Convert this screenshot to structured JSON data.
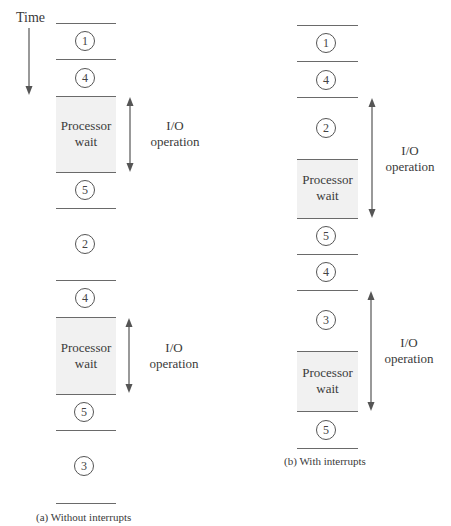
{
  "time_label": "Time",
  "panel_a": {
    "caption": "(a) Without interrupts",
    "segments": [
      {
        "type": "step",
        "label": "1"
      },
      {
        "type": "step",
        "label": "4"
      },
      {
        "type": "wait",
        "label_line1": "Processor",
        "label_line2": "wait"
      },
      {
        "type": "step",
        "label": "5"
      },
      {
        "type": "step",
        "label": "2"
      },
      {
        "type": "step",
        "label": "4"
      },
      {
        "type": "wait",
        "label_line1": "Processor",
        "label_line2": "wait"
      },
      {
        "type": "step",
        "label": "5"
      },
      {
        "type": "step",
        "label": "3"
      }
    ],
    "io_ops": [
      {
        "line1": "I/O",
        "line2": "operation"
      },
      {
        "line1": "I/O",
        "line2": "operation"
      }
    ]
  },
  "panel_b": {
    "caption": "(b) With interrupts",
    "segments": [
      {
        "type": "step",
        "label": "1"
      },
      {
        "type": "step",
        "label": "4"
      },
      {
        "type": "step",
        "label": "2"
      },
      {
        "type": "wait",
        "label_line1": "Processor",
        "label_line2": "wait"
      },
      {
        "type": "step",
        "label": "5"
      },
      {
        "type": "step",
        "label": "4"
      },
      {
        "type": "step",
        "label": "3"
      },
      {
        "type": "wait",
        "label_line1": "Processor",
        "label_line2": "wait"
      },
      {
        "type": "step",
        "label": "5"
      }
    ],
    "io_ops": [
      {
        "line1": "I/O",
        "line2": "operation"
      },
      {
        "line1": "I/O",
        "line2": "operation"
      }
    ]
  },
  "colors": {
    "line": "#6a6a6a",
    "shade": "#f1f1f1",
    "text": "#3a3a3a"
  }
}
